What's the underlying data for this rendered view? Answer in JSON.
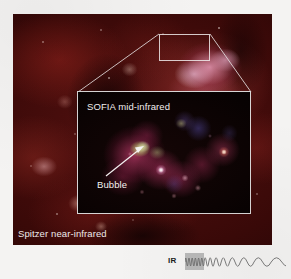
{
  "figure": {
    "type": "astronomical-composite-image",
    "background_color": "#f4f3f2"
  },
  "main_image": {
    "name": "spitzer-panel",
    "label": "Spitzer near-infrared",
    "instrument": "Spitzer",
    "band": "near-infrared",
    "dominant_colors": [
      "#2a0505",
      "#551110",
      "#a83c37",
      "#c8809a",
      "#f0dcea"
    ],
    "description": "Dark red infrared nebula field with pink star-forming complex at upper right"
  },
  "callout": {
    "name": "source-region-box",
    "border_color": "#f0ebeb",
    "connector_color": "#e6e0e0"
  },
  "inset_image": {
    "name": "sofia-panel",
    "label": "SOFIA mid-infrared",
    "instrument": "SOFIA",
    "band": "mid-infrared",
    "border_color": "#f0ecec",
    "dominant_colors": [
      "#030101",
      "#c43c6e",
      "#d6e296",
      "#ffffff",
      "#ffe4cc"
    ],
    "description": "Magnified mid-infrared view showing a chain of bright knots along a magenta emission arc"
  },
  "annotations": {
    "bubble": {
      "label": "Bubble",
      "arrow_color": "#f4f1f1",
      "points_to": "green-yellow core"
    }
  },
  "legend": {
    "name": "infrared-wavelength-legend",
    "label": "IR",
    "label_color": "#1b1b1b",
    "wave_color": "#7d7d7d",
    "block_color": "#b9b9b9",
    "description": "Wave whose wavelength increases left to right, indicating the infrared part of the spectrum"
  }
}
